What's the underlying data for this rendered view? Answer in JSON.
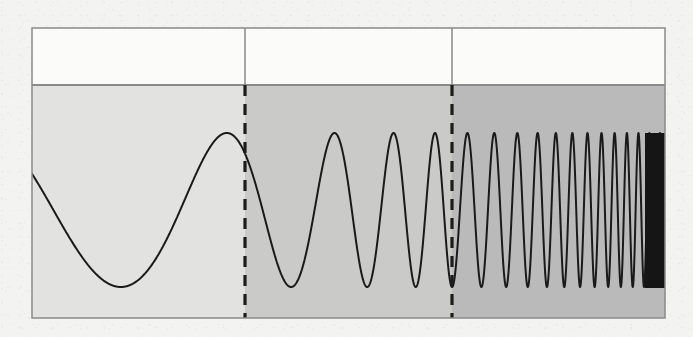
{
  "figure": {
    "kind": "scanned-figure",
    "page_background": "#f3f3f1",
    "caption": "",
    "title": ""
  },
  "frame": {
    "x": 32,
    "y": 28,
    "width": 633,
    "height": 290,
    "border_color": "#8a8a8a",
    "border_width": 1.5
  },
  "header_band": {
    "y": 28,
    "height": 57,
    "fill": "#fbfbfa",
    "divider_color": "#8a8a8a",
    "cells": [
      {
        "label": "",
        "x": 32,
        "width": 213
      },
      {
        "label": "",
        "x": 245,
        "width": 207
      },
      {
        "label": "",
        "x": 452,
        "width": 213
      }
    ]
  },
  "plot_area": {
    "x": 32,
    "y": 85,
    "width": 633,
    "height": 233,
    "baseline_y": 210
  },
  "regions": [
    {
      "name": "region-1",
      "label": "",
      "x": 32,
      "width": 213,
      "fill": "#e2e2e0"
    },
    {
      "name": "region-2",
      "label": "",
      "x": 245,
      "width": 207,
      "fill": "#cacac8"
    },
    {
      "name": "region-3",
      "label": "",
      "x": 452,
      "width": 213,
      "fill": "#bababa"
    }
  ],
  "dividers": [
    {
      "name": "divider-1",
      "x": 245,
      "style": "dashed",
      "color": "#1c1c1c",
      "width": 3.2,
      "dash": "11 8"
    },
    {
      "name": "divider-2",
      "x": 452,
      "style": "dashed",
      "color": "#1c1c1c",
      "width": 3.2,
      "dash": "11 8"
    }
  ],
  "waveform": {
    "name": "chirp-curve",
    "stroke": "#1a1a1a",
    "stroke_width": 2.0,
    "amplitude_px": 77,
    "center_y": 210,
    "peak_y": 133,
    "trough_y": 288,
    "start_x": 32,
    "end_x": 665,
    "saturation_block": {
      "x": 645,
      "width": 20,
      "top_y": 133,
      "bottom_y": 288,
      "fill": "#151515"
    }
  },
  "chart_data": {
    "type": "line",
    "title": "",
    "subtitle": "",
    "xlabel": "",
    "ylabel": "",
    "legend": [],
    "grid": false,
    "signal": "linear chirp (frequency increases left to right)",
    "amplitude": 1.0,
    "ylim": [
      -1.3,
      1.3
    ],
    "xlim": [
      0,
      1
    ],
    "start_phase_deg": 62,
    "f_start_cycles_per_unit": 2.3,
    "f_end_cycles_per_unit": 64,
    "chirp_exponent": 3.1,
    "samples": 4000,
    "region_cycle_counts": [
      1.6,
      2.0,
      9.0
    ],
    "annotations": [
      {
        "name": "region-boundary-1",
        "x_px": 245,
        "text": ""
      },
      {
        "name": "region-boundary-2",
        "x_px": 452,
        "text": ""
      }
    ]
  }
}
